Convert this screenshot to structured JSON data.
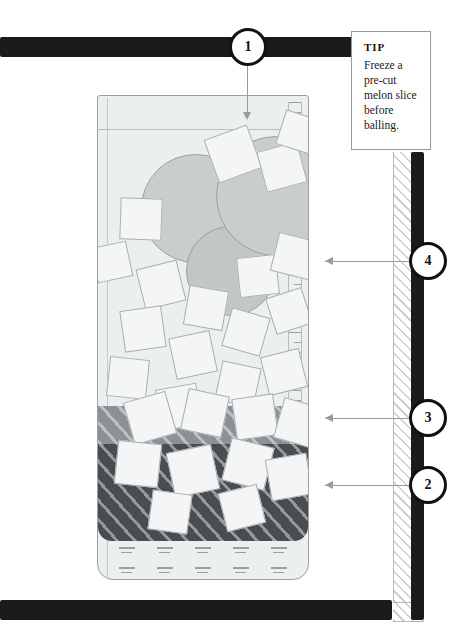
{
  "illustration": {
    "title": "Layered melon and ice drink assembly diagram",
    "subject": "tall glass with melon balls, ice cubes and two liquid layers"
  },
  "tip": {
    "heading": "TIP",
    "body": "Freeze a pre-cut melon slice before balling."
  },
  "callouts": [
    {
      "number": "1",
      "name": "callout-1",
      "target": "glass-top-opening"
    },
    {
      "number": "4",
      "name": "callout-4",
      "target": "ice-and-melon-zone"
    },
    {
      "number": "3",
      "name": "callout-3",
      "target": "middle-liquid-layer"
    },
    {
      "number": "2",
      "name": "callout-2",
      "target": "dark-liquid-layer"
    }
  ],
  "glass": {
    "name": "tall-drink-glass",
    "layers": [
      {
        "name": "upper-clear-zone",
        "shade": "#eceff0"
      },
      {
        "name": "middle-liquid-layer",
        "shade": "#8e9194"
      },
      {
        "name": "dark-liquid-layer",
        "shade": "#4a4d50"
      },
      {
        "name": "base-sediment-zone",
        "shade": "#eceff0"
      }
    ],
    "melon_balls": 3,
    "ice_cubes": 26,
    "ruler": {
      "name": "measure-scale",
      "ticks": 34
    }
  },
  "colors": {
    "frame": "#1b1b1b",
    "leader": "#9a9a9a",
    "glass_outline": "#9aa0a2",
    "melon": "#c9cdce",
    "ice": "#f3f5f6",
    "liquid_mid": "#8e9194",
    "liquid_dark": "#4a4d50"
  }
}
